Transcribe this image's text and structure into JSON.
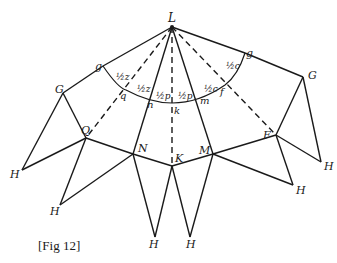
{
  "caption": "[Fig 12]",
  "points": {
    "L": "L",
    "g_left": "g",
    "g_right": "g",
    "G_left": "G",
    "G_right": "G",
    "q": "q",
    "n": "n",
    "k": "k",
    "m": "m",
    "f": "f",
    "Q": "Q",
    "N": "N",
    "K": "K",
    "M": "M",
    "F": "F",
    "H1": "H",
    "H2": "H",
    "H3": "H",
    "H4": "H",
    "H5": "H",
    "H6": "H"
  },
  "angle_labels": {
    "half_z_1": "½z",
    "half_z_2": "½z",
    "half_p_1": "½p",
    "half_p_2": "½p",
    "half_c_1": "½c",
    "half_c_2": "½c"
  },
  "colors": {
    "stroke": "#1a1a1a",
    "background": "#ffffff"
  }
}
